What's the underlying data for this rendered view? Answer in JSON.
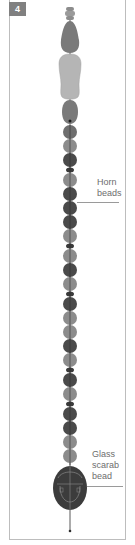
{
  "figure": {
    "number": "4",
    "colors": {
      "light_bead": "#8c8c8c",
      "dark_bead": "#4a4a4a",
      "spacer": "#3a3a3a",
      "pendant_light": "#b5b5b5",
      "scarab": "#3c3c3c",
      "thread": "#2e2e2e",
      "label_text": "#6d6d6d",
      "frame": "#bdbdbd",
      "badge_bg": "#808080"
    },
    "labels": {
      "horn": {
        "line1": "Horn",
        "line2": "beads"
      },
      "scarab": {
        "line1": "Glass",
        "line2": "scarab",
        "line3": "bead"
      }
    }
  }
}
